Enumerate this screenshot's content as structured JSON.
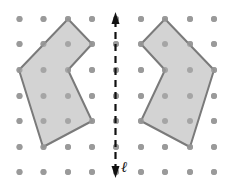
{
  "diagram": {
    "type": "reflection-on-dot-grid",
    "grid": {
      "columns_x": [
        19.5,
        43.5,
        68,
        92,
        116,
        141,
        165,
        190,
        214
      ],
      "rows_y": [
        19,
        44,
        70,
        96,
        121,
        147,
        172
      ],
      "dot_color": "#9a9a9a",
      "dot_radius": 3
    },
    "line_of_reflection": {
      "label": "ℓ",
      "x": 115.5,
      "y_start": 12,
      "y_end": 178,
      "style": "dashed",
      "arrows": "both",
      "color": "#111111"
    },
    "shapes": [
      {
        "name": "original-polygon",
        "points": [
          [
            68,
            19
          ],
          [
            92,
            44
          ],
          [
            68,
            70
          ],
          [
            92,
            121
          ],
          [
            43,
            147
          ],
          [
            19,
            70
          ]
        ],
        "fill": "#d3d3d3",
        "stroke": "#7a7a7a"
      },
      {
        "name": "reflected-polygon",
        "points": [
          [
            165,
            19
          ],
          [
            141,
            44
          ],
          [
            165,
            70
          ],
          [
            141,
            121
          ],
          [
            190,
            147
          ],
          [
            214,
            70
          ]
        ],
        "fill": "#d3d3d3",
        "stroke": "#7a7a7a"
      }
    ]
  }
}
